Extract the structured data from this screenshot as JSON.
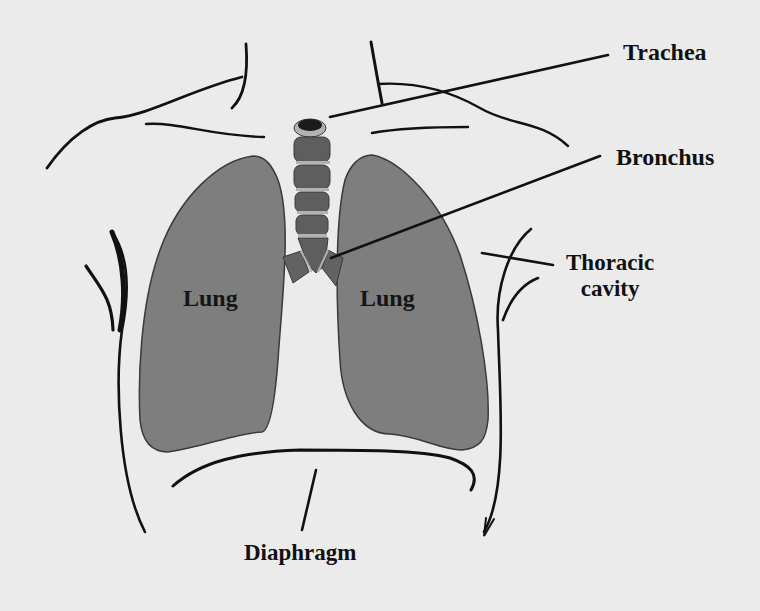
{
  "diagram": {
    "colors": {
      "background": "#ebebeb",
      "lung_fill": "#7e7e7e",
      "lung_stroke": "#3a3a3a",
      "trachea_ring": "#5e5e5e",
      "trachea_band": "#b2b2b2",
      "trachea_opening": "#1a1a1a",
      "outline": "#111111",
      "label_text": "#111111"
    },
    "labels": {
      "trachea": "Trachea",
      "bronchus": "Bronchus",
      "thoracic_line1": "Thoracic",
      "thoracic_line2": "cavity",
      "diaphragm": "Diaphragm",
      "lung_left": "Lung",
      "lung_right": "Lung"
    },
    "structures": [
      {
        "name": "Trachea",
        "type": "airway"
      },
      {
        "name": "Bronchus",
        "type": "airway"
      },
      {
        "name": "Lung",
        "side": "left"
      },
      {
        "name": "Lung",
        "side": "right"
      },
      {
        "name": "Thoracic cavity",
        "type": "body-cavity"
      },
      {
        "name": "Diaphragm",
        "type": "muscle"
      }
    ]
  }
}
